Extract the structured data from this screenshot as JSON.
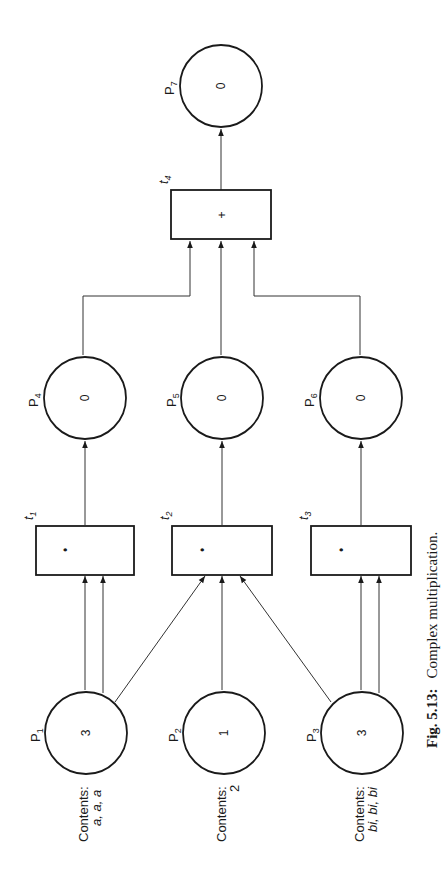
{
  "figure": {
    "caption_label": "Fig. 5.13:",
    "caption_text": "Complex multiplication."
  },
  "places": [
    {
      "id": "P1",
      "name": "P",
      "sub": "1",
      "tokens": "3",
      "contents_label": "Contents:",
      "contents_value": "a, a, a"
    },
    {
      "id": "P2",
      "name": "P",
      "sub": "2",
      "tokens": "1",
      "contents_label": "Contents:",
      "contents_value": "2"
    },
    {
      "id": "P3",
      "name": "P",
      "sub": "3",
      "tokens": "3",
      "contents_label": "Contents:",
      "contents_value": "bi, bi, bi"
    },
    {
      "id": "P4",
      "name": "P",
      "sub": "4",
      "tokens": "0"
    },
    {
      "id": "P5",
      "name": "P",
      "sub": "5",
      "tokens": "0"
    },
    {
      "id": "P6",
      "name": "P",
      "sub": "6",
      "tokens": "0"
    },
    {
      "id": "P7",
      "name": "P",
      "sub": "7",
      "tokens": "0"
    }
  ],
  "transitions": [
    {
      "id": "t1",
      "name": "t",
      "sub": "1",
      "op": "•"
    },
    {
      "id": "t2",
      "name": "t",
      "sub": "2",
      "op": "•"
    },
    {
      "id": "t3",
      "name": "t",
      "sub": "3",
      "op": "•"
    },
    {
      "id": "t4",
      "name": "t",
      "sub": "4",
      "op": "+"
    }
  ],
  "arcs": [
    {
      "from": "P1",
      "to": "t1",
      "count": 2
    },
    {
      "from": "P1",
      "to": "t2",
      "count": 1
    },
    {
      "from": "P2",
      "to": "t2",
      "count": 1
    },
    {
      "from": "P3",
      "to": "t2",
      "count": 1
    },
    {
      "from": "P3",
      "to": "t3",
      "count": 2
    },
    {
      "from": "t1",
      "to": "P4",
      "count": 1
    },
    {
      "from": "t2",
      "to": "P5",
      "count": 1
    },
    {
      "from": "t3",
      "to": "P6",
      "count": 1
    },
    {
      "from": "P4",
      "to": "t4",
      "count": 1
    },
    {
      "from": "P5",
      "to": "t4",
      "count": 1
    },
    {
      "from": "P6",
      "to": "t4",
      "count": 1
    },
    {
      "from": "t4",
      "to": "P7",
      "count": 1
    }
  ]
}
